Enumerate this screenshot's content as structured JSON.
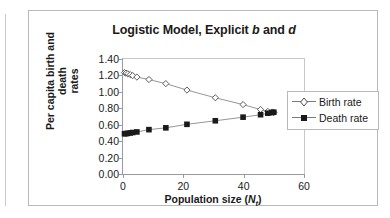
{
  "chart_data": {
    "type": "line",
    "title": "Logistic Model, Explicit b and d",
    "title_parts": {
      "pre": "Logistic Model, Explicit ",
      "italic_b": "b",
      "mid": " and ",
      "italic_d": "d"
    },
    "xlabel": "Population size (Nt)",
    "xlabel_parts": {
      "pre": "Population size (",
      "italic_n": "N",
      "sub_t": "t",
      "post": ")"
    },
    "ylabel": "Per capita birth and death rates",
    "ylabel_line1": "Per capita birth and death",
    "ylabel_line2": "rates",
    "xlim": [
      0,
      60
    ],
    "ylim": [
      0,
      1.4
    ],
    "xticks": [
      0,
      20,
      40,
      60
    ],
    "xtick_labels": [
      "0",
      "20",
      "40",
      "60"
    ],
    "yticks": [
      0.0,
      0.2,
      0.4,
      0.6,
      0.8,
      1.0,
      1.2,
      1.4
    ],
    "ytick_labels": [
      "0.00",
      "0.20",
      "0.40",
      "0.60",
      "0.80",
      "1.00",
      "1.20",
      "1.40"
    ],
    "grid": false,
    "legend_position": "right",
    "series": [
      {
        "name": "Birth rate",
        "marker": "open-diamond",
        "color": "#4d4d4d",
        "x": [
          0.5,
          1.0,
          1.6,
          2.4,
          3.2,
          4.6,
          8.6,
          14.2,
          21.2,
          30.6,
          39.8,
          45.6,
          48.0,
          49.3,
          50.0
        ],
        "y": [
          1.235,
          1.228,
          1.22,
          1.21,
          1.198,
          1.18,
          1.15,
          1.1,
          1.022,
          0.928,
          0.845,
          0.785,
          0.762,
          0.754,
          0.75
        ]
      },
      {
        "name": "Death rate",
        "marker": "filled-square",
        "color": "#1a1a1a",
        "x": [
          0.5,
          1.0,
          1.6,
          2.4,
          3.2,
          4.6,
          8.6,
          14.2,
          21.2,
          30.6,
          39.8,
          45.6,
          48.0,
          49.3,
          50.0
        ],
        "y": [
          0.49,
          0.492,
          0.495,
          0.5,
          0.505,
          0.512,
          0.54,
          0.562,
          0.605,
          0.648,
          0.692,
          0.722,
          0.74,
          0.748,
          0.752
        ]
      }
    ]
  },
  "legend": {
    "items": [
      {
        "label": "Birth rate"
      },
      {
        "label": "Death rate"
      }
    ]
  }
}
